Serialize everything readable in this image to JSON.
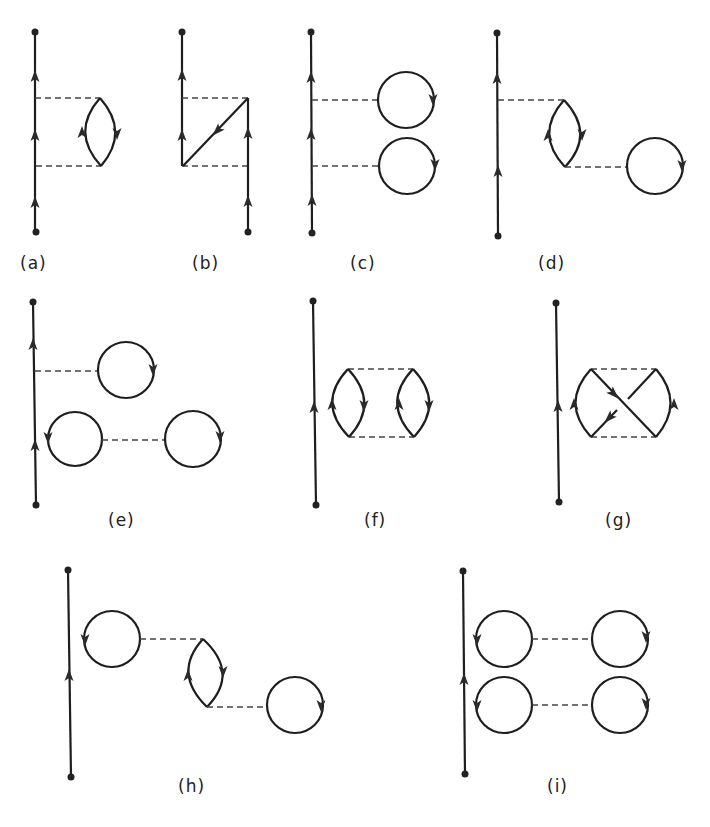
{
  "figure": {
    "panels": [
      {
        "id": "a",
        "label": "(a)"
      },
      {
        "id": "b",
        "label": "(b)"
      },
      {
        "id": "c",
        "label": "(c)"
      },
      {
        "id": "d",
        "label": "(d)"
      },
      {
        "id": "e",
        "label": "(e)"
      },
      {
        "id": "f",
        "label": "(f)"
      },
      {
        "id": "g",
        "label": "(g)"
      },
      {
        "id": "h",
        "label": "(h)"
      },
      {
        "id": "i",
        "label": "(i)"
      }
    ],
    "colors": {
      "line": "#1e1e1e",
      "background": "#ffffff"
    }
  }
}
